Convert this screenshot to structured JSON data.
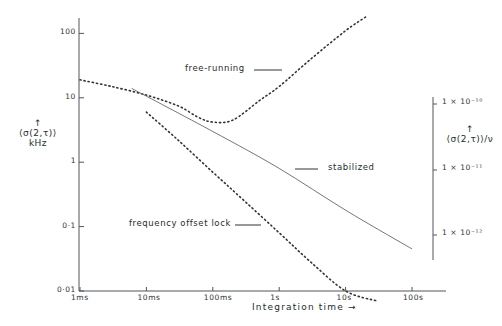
{
  "chart_data": {
    "type": "line",
    "title": "",
    "xlabel": "Integration time",
    "xlabel_arrow": "→",
    "xscale": "log",
    "yscale": "log",
    "ylabel_left": {
      "line1": "↑",
      "line2": "⟨σ(2,τ)⟩",
      "line3": "kHz"
    },
    "ylabel_right": {
      "line1": "↑",
      "line2": "⟨σ(2,τ)⟩/ν"
    },
    "x_ticks": [
      "1ms",
      "10ms",
      "100ms",
      "1s",
      "10s",
      "100s"
    ],
    "x_tick_values_s": [
      0.001,
      0.01,
      0.1,
      1,
      10,
      100
    ],
    "y_ticks": [
      "0·01",
      "0·1",
      "1",
      "10",
      "100"
    ],
    "y_tick_values_khz": [
      0.01,
      0.1,
      1,
      10,
      100
    ],
    "right_ticks": [
      "1 × 10⁻¹⁰",
      "1 × 10⁻¹¹",
      "1 × 10⁻¹²"
    ],
    "right_tick_values": [
      1e-10,
      1e-11,
      1e-12
    ],
    "xlim_s": [
      0.001,
      250
    ],
    "ylim_khz": [
      0.01,
      200
    ],
    "grid": false,
    "legend_position": "inline labels",
    "series": [
      {
        "name": "free-running",
        "style": "dotted",
        "x_s": [
          0.001,
          0.003,
          0.01,
          0.03,
          0.06,
          0.1,
          0.2,
          0.5,
          1,
          3,
          10,
          20
        ],
        "y_khz": [
          19,
          15,
          11,
          7.5,
          5,
          4.2,
          4.5,
          9,
          15,
          40,
          110,
          180
        ]
      },
      {
        "name": "stabilized",
        "style": "solid",
        "x_s": [
          0.006,
          0.1,
          1,
          10,
          100
        ],
        "y_khz": [
          14,
          3,
          0.8,
          0.18,
          0.045
        ]
      },
      {
        "name": "frequency offset lock",
        "style": "dotted",
        "x_s": [
          0.01,
          0.03,
          0.1,
          0.3,
          1,
          3,
          10,
          30
        ],
        "y_khz": [
          6,
          2.2,
          0.7,
          0.25,
          0.08,
          0.028,
          0.01,
          0.007
        ]
      }
    ],
    "annotations": [
      "free-running",
      "stabilized",
      "frequency offset lock"
    ]
  }
}
